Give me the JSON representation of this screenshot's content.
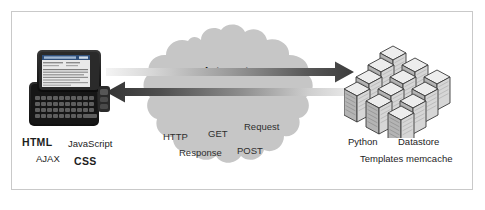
{
  "figure": {
    "caption": "",
    "border_color": "#c9c9c9"
  },
  "client": {
    "device_name": "smartphone-with-slideout-keyboard",
    "screen_content_name": "web-page-on-phone-screen",
    "labels": {
      "html": "HTML",
      "javascript": "JavaScript",
      "ajax": "AJAX",
      "css": "CSS"
    }
  },
  "cloud": {
    "title": "Internet",
    "fill_color": "#c6c6c6",
    "protocols": {
      "http": "HTTP",
      "get": "GET",
      "request": "Request",
      "response": "Response",
      "post": "POST"
    }
  },
  "arrows": {
    "request_arrow": {
      "name": "request-arrow-right",
      "direction": "right",
      "gradient_from": "#f2f2f2",
      "gradient_to": "#3f3f3f"
    },
    "response_arrow": {
      "name": "response-arrow-left",
      "direction": "left",
      "gradient_from": "#3a3a3a",
      "gradient_to": "#e6e6e6"
    }
  },
  "server": {
    "cluster_name": "server-rack-cluster",
    "rack_color": "#d2d2d2",
    "labels": {
      "python": "Python",
      "datastore": "Datastore",
      "templates": "Templates",
      "memcache": "memcache"
    }
  }
}
